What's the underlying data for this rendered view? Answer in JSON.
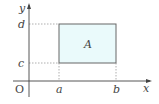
{
  "diagram": {
    "type": "coordinate-region",
    "axes": {
      "x_label": "x",
      "y_label": "y",
      "origin_label": "O"
    },
    "ticks": {
      "x": [
        "a",
        "b"
      ],
      "y": [
        "c",
        "d"
      ]
    },
    "region": {
      "label": "A",
      "x_range": [
        "a",
        "b"
      ],
      "y_range": [
        "c",
        "d"
      ],
      "fill": "#eafafb",
      "stroke": "#555555"
    },
    "colors": {
      "axis": "#444444",
      "dashed": "#999999"
    }
  }
}
